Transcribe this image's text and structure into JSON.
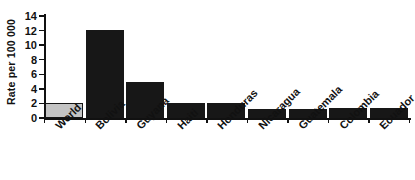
{
  "chart_data": {
    "type": "bar",
    "title": "",
    "subtitle": "",
    "xlabel": "",
    "ylabel": "Rate per 100 000",
    "ylim": [
      0,
      14
    ],
    "ytick_values": [
      0,
      2,
      4,
      6,
      8,
      10,
      12,
      14
    ],
    "ytick_labels": [
      "0",
      "2",
      "4",
      "6",
      "8",
      "10",
      "12",
      "14"
    ],
    "grid": false,
    "legend": null,
    "categories": [
      "World",
      "Bolivia",
      "Guyana",
      "Haiti",
      "Honduras",
      "Nicaragua",
      "Guatemala",
      "Colombia",
      "Ecuador"
    ],
    "values": [
      2.0,
      12.1,
      5.0,
      2.1,
      2.1,
      1.3,
      1.3,
      1.35,
      1.4
    ],
    "bars": [
      {
        "label": "World",
        "value": 2.0,
        "style": "highlight",
        "color": "#c4c4c4"
      },
      {
        "label": "Bolivia",
        "value": 12.1,
        "style": "solid",
        "color": "#171717"
      },
      {
        "label": "Guyana",
        "value": 5.0,
        "style": "solid",
        "color": "#171717"
      },
      {
        "label": "Haiti",
        "value": 2.1,
        "style": "solid",
        "color": "#171717"
      },
      {
        "label": "Honduras",
        "value": 2.1,
        "style": "solid",
        "color": "#171717"
      },
      {
        "label": "Nicaragua",
        "value": 1.3,
        "style": "solid",
        "color": "#171717"
      },
      {
        "label": "Guatemala",
        "value": 1.3,
        "style": "solid",
        "color": "#171717"
      },
      {
        "label": "Colombia",
        "value": 1.35,
        "style": "solid",
        "color": "#171717"
      },
      {
        "label": "Ecuador",
        "value": 1.4,
        "style": "solid",
        "color": "#171717"
      }
    ],
    "colors": {
      "bar_default": "#171717",
      "bar_highlight_fill": "#c4c4c4",
      "bar_highlight_edge": "#151515",
      "axis": "#111111",
      "text": "#111111",
      "background": "#ffffff"
    }
  }
}
